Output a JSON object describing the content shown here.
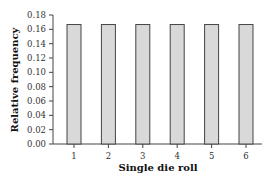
{
  "chart_data": {
    "type": "bar",
    "title": "",
    "xlabel": "Single die roll",
    "ylabel": "Relative frequency",
    "categories": [
      "1",
      "2",
      "3",
      "4",
      "5",
      "6"
    ],
    "values": [
      0.1667,
      0.1667,
      0.1667,
      0.1667,
      0.1667,
      0.1667
    ],
    "ylim": [
      0,
      0.18
    ],
    "yticks": [
      "0.00",
      "0.02",
      "0.04",
      "0.06",
      "0.08",
      "0.10",
      "0.12",
      "0.14",
      "0.16",
      "0.18"
    ],
    "grid": false,
    "legend": null,
    "colors": {
      "bar_fill": "#d9d9d9",
      "bar_stroke": "#444444",
      "axis": "#444444"
    }
  }
}
